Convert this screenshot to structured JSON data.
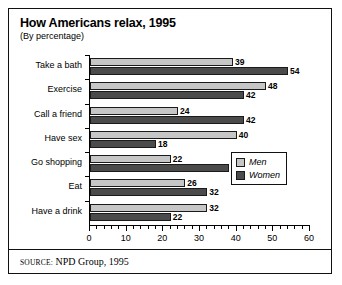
{
  "chart_data": {
    "type": "bar",
    "orientation": "horizontal",
    "title": "How Americans relax, 1995",
    "subtitle": "(By percentage)",
    "xlabel": "",
    "ylabel": "",
    "xlim": [
      0,
      60
    ],
    "xticks": [
      0,
      10,
      20,
      30,
      40,
      50,
      60
    ],
    "xtick_labels": [
      "0",
      "10",
      "20",
      "30",
      "40",
      "50",
      "60"
    ],
    "minor_tick_step": 2,
    "grid": false,
    "legend_position": "middle-right",
    "categories": [
      "Take a bath",
      "Exercise",
      "Call a friend",
      "Have sex",
      "Go shopping",
      "Eat",
      "Have a drink"
    ],
    "series": [
      {
        "name": "Men",
        "color": "#c6c6c6",
        "values": [
          39,
          48,
          24,
          40,
          22,
          26,
          32
        ]
      },
      {
        "name": "Women",
        "color": "#4b4b4b",
        "values": [
          54,
          42,
          42,
          18,
          38,
          32,
          22
        ]
      }
    ]
  },
  "source": {
    "label": "SOURCE:",
    "text": "NPD Group, 1995"
  }
}
